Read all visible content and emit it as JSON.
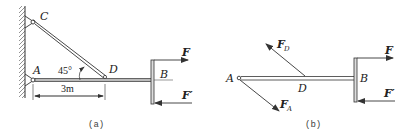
{
  "figure_a": {
    "caption": "(a)",
    "labels": {
      "C": "C",
      "A": "A",
      "D": "D",
      "B": "B",
      "F": "F",
      "F_prime": "F′",
      "angle": "45°",
      "dimension": "3m"
    }
  },
  "figure_b": {
    "caption": "(b)",
    "labels": {
      "A": "A",
      "D": "D",
      "B": "B",
      "F": "F",
      "F_prime": "F′",
      "FD_main": "F",
      "FD_sub": "D",
      "FA_main": "F",
      "FA_sub": "A"
    }
  },
  "colors": {
    "line": "#333333",
    "hatch": "#666666",
    "background": "#ffffff"
  }
}
